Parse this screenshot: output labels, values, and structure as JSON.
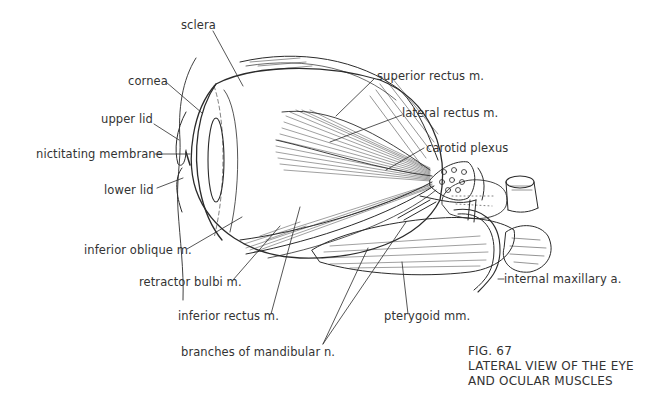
{
  "figure": {
    "number": "FIG. 67",
    "title_line1": "LATERAL VIEW OF THE EYE",
    "title_line2": "AND OCULAR MUSCLES"
  },
  "labels": {
    "sclera": "sclera",
    "cornea": "cornea",
    "upper_lid": "upper lid",
    "nictitating_membrane": "nictitating membrane",
    "lower_lid": "lower lid",
    "superior_rectus": "superior rectus m.",
    "lateral_rectus": "lateral rectus m.",
    "carotid_plexus": "carotid plexus",
    "inferior_oblique": "inferior oblique m.",
    "retractor_bulbi": "retractor bulbi m.",
    "inferior_rectus": "inferior rectus m.",
    "branches_mandibular": "branches of mandibular n.",
    "pterygoid": "pterygoid mm.",
    "internal_maxillary": "internal maxillary a."
  },
  "colors": {
    "ink": "#2b2b2b",
    "background": "#ffffff"
  }
}
